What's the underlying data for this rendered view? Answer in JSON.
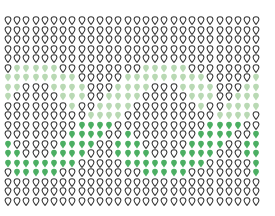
{
  "chart_data": {
    "type": "heatmap",
    "title": "",
    "subtitle": "",
    "xlabel": "",
    "ylabel": "",
    "legend": [],
    "columns": 28,
    "rows": 20,
    "states": {
      "O": {
        "name": "outline",
        "fill": "none",
        "stroke": "#3a3a3a"
      },
      "L": {
        "name": "light-green",
        "fill": "#b9d9b4",
        "stroke": "#b9d9b4"
      },
      "D": {
        "name": "dark-green",
        "fill": "#4caf63",
        "stroke": "#4caf63"
      }
    },
    "grid": [
      "OOOOOOOOOOOOOOOOOOOOOOOOOOOO",
      "OOOOOOOOOOOOOOOOOOOOOOOOOOOO",
      "OOOOOOOOOOOOOOOOOOOOOOOOOOOO",
      "OOOOOOOOOOOOOOOOOOOOOOOOOOOO",
      "OOOOOOOOOOOOOOOOOOOOOOOOOOOO",
      "OLLLLLOOOOOOOOOLLLLLOOOOOOOO",
      "LLLLLLLLOOOOOLLLLLLLLLOOOOOL",
      "LLOOOLLLLOOOLLLLOOOLLLLOOOLL",
      "LOOOOOLLLOOLLLLOOOOOLLLOOLLL",
      "OOOOOOOLOOLLLLOOOOOOOLOOLLLL",
      "OOOOOOOOOLLLLOOOOOOOOOOLLLLO",
      "OOOOOOOODDDDOOOOOOOOOODDDDOO",
      "OOOOOOODDDDOODOOOOOOODDDDOOD",
      "DOOOOODDDDOODDDOOOOODDDDOODD",
      "DDOOODDDDOOODDDDOOODDDDOOODD",
      "DDDDDDDDOOOOODDDDDDDDDOOOOOD",
      "ODDDDDOOOOOOOOODDDDDOOOOOOOD",
      "OOOOOOOOOOOOOOOOOOOOOOOOOOOO",
      "OOOOOOOOOOOOOOOOOOOOOOOOOOOO",
      "OOOOOOOOOOOOOOOOOOOOOOOOOOOO"
    ],
    "layout": {
      "origin_x": 4,
      "origin_y": 16,
      "step_x": 9.2,
      "step_y": 9.5
    }
  }
}
